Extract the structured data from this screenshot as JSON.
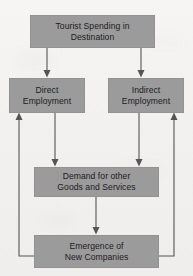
{
  "diagram": {
    "canvas": {
      "width": 193,
      "height": 276
    },
    "style": {
      "node_fill": "#9b9b9b",
      "node_text_color": "#1c1c1c",
      "edge_color": "#555555",
      "background": "#f2f1ef"
    },
    "nodes": [
      {
        "id": "top",
        "label": "Tourist Spending in\nDestination"
      },
      {
        "id": "direct",
        "label": "Direct\nEmployment"
      },
      {
        "id": "indirect",
        "label": "Indirect\nEmployment"
      },
      {
        "id": "demand",
        "label": "Demand for other\nGoods and Services"
      },
      {
        "id": "emerge",
        "label": "Emergence of\nNew Companies"
      }
    ],
    "edges": [
      {
        "id": "e1",
        "from": "top",
        "to": "direct",
        "style": "straight-down",
        "arrow": "down"
      },
      {
        "id": "e2",
        "from": "top",
        "to": "indirect",
        "style": "straight-down",
        "arrow": "down"
      },
      {
        "id": "e3",
        "from": "direct",
        "to": "demand",
        "style": "straight-down",
        "arrow": "down"
      },
      {
        "id": "e4",
        "from": "indirect",
        "to": "demand",
        "style": "straight-down",
        "arrow": "down"
      },
      {
        "id": "e5",
        "from": "demand",
        "to": "emerge",
        "style": "straight-down",
        "arrow": "down"
      },
      {
        "id": "e6",
        "from": "emerge",
        "to": "direct",
        "style": "feedback-left",
        "arrow": "up"
      },
      {
        "id": "e7",
        "from": "emerge",
        "to": "indirect",
        "style": "feedback-right",
        "arrow": "up"
      }
    ]
  }
}
